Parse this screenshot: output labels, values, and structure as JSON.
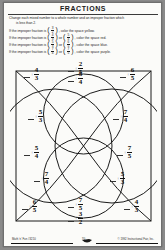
{
  "page": {
    "title": "FRACTIONS",
    "lead_line1": "Change each mixed number to a whole number and an improper fraction which",
    "lead_line2": "is less than 2.",
    "rules": [
      {
        "prefix": "If the improper fraction is",
        "frac1": {
          "n": "3",
          "d": "2"
        },
        "frac2": null,
        "suffix": ", color the space yellow."
      },
      {
        "prefix": "If the improper fraction is",
        "frac1": {
          "n": "4",
          "d": "3"
        },
        "frac2": {
          "n": "5",
          "d": "4"
        },
        "suffix": ", color the space red."
      },
      {
        "prefix": "If the improper fraction is",
        "frac1": {
          "n": "5",
          "d": "3"
        },
        "frac2": {
          "n": "6",
          "d": "5"
        },
        "suffix": ", color the space blue."
      },
      {
        "prefix": "If the improper fraction is",
        "frac1": {
          "n": "7",
          "d": "4"
        },
        "frac2": {
          "n": "7",
          "d": "5"
        },
        "suffix": ", color the space purple."
      }
    ],
    "footer": {
      "left": "Math 'n' Fun  #3210",
      "page": "70",
      "right": "© 1992 Instructional Fair, Inc."
    }
  },
  "diagram": {
    "cells": [
      {
        "id": "top-left",
        "x": 14,
        "y": 8,
        "numerator": "4",
        "denominator": "3"
      },
      {
        "id": "top-center",
        "x": 58,
        "y": 2,
        "numerator": "2",
        "denominator": "5"
      },
      {
        "id": "top-center-low",
        "x": 58,
        "y": 12,
        "numerator": "5",
        "denominator": "4"
      },
      {
        "id": "top-right",
        "x": 110,
        "y": 8,
        "numerator": "6",
        "denominator": "5"
      },
      {
        "id": "mid-left-upper",
        "x": 18,
        "y": 50,
        "numerator": "5",
        "denominator": "3"
      },
      {
        "id": "mid-right-upper",
        "x": 103,
        "y": 50,
        "numerator": "7",
        "denominator": "4"
      },
      {
        "id": "mid-left-lower",
        "x": 14,
        "y": 86,
        "numerator": "5",
        "denominator": "4"
      },
      {
        "id": "mid-right-lower",
        "x": 107,
        "y": 86,
        "numerator": "7",
        "denominator": "5"
      },
      {
        "id": "low-left",
        "x": 24,
        "y": 112,
        "numerator": "7",
        "denominator": "4"
      },
      {
        "id": "low-right",
        "x": 100,
        "y": 112,
        "numerator": "5",
        "denominator": "3"
      },
      {
        "id": "bot-left",
        "x": 12,
        "y": 140,
        "numerator": "6",
        "denominator": "5"
      },
      {
        "id": "bot-center",
        "x": 58,
        "y": 138,
        "numerator": "7",
        "denominator": "5"
      },
      {
        "id": "bot-center-low",
        "x": 58,
        "y": 152,
        "numerator": "3",
        "denominator": "2"
      },
      {
        "id": "bot-right",
        "x": 114,
        "y": 140,
        "numerator": "4",
        "denominator": "3"
      }
    ]
  }
}
